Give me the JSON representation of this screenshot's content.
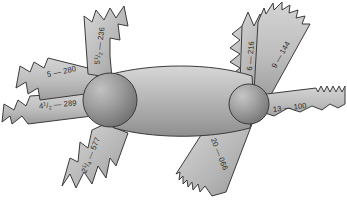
{
  "figure": {
    "background_color": "#ffffff",
    "outline_color": "#3b3b3b",
    "blade_fill_light": "#cfcfcf",
    "blade_fill_dark": "#9a9a9a",
    "body_fill_light": "#c6c6c6",
    "body_fill_dark": "#8e8e8e",
    "hub_fill_light": "#b5b5b5",
    "hub_fill_dark": "#6e6e6e",
    "label_color": "#2a2a2a"
  },
  "hubs": [
    {
      "name": "left-hub",
      "cx": 110,
      "cy": 100,
      "r": 27
    },
    {
      "name": "right-hub",
      "cx": 249,
      "cy": 104,
      "r": 20
    }
  ],
  "blades": [
    {
      "id": "blade-5-280",
      "side": "left",
      "position": "upper-left",
      "tpi": "5",
      "dash": "—",
      "code": "280",
      "label": "5 — 280",
      "tooth_size": "coarse"
    },
    {
      "id": "blade-5h-236",
      "side": "left",
      "position": "top",
      "tpi": "5",
      "fraction_num": "1",
      "fraction_den": "2",
      "dash": "—",
      "code": "236",
      "label": "5½ — 236",
      "tooth_size": "coarse"
    },
    {
      "id": "blade-4h-289",
      "side": "left",
      "position": "left",
      "tpi": "4",
      "fraction_num": "1",
      "fraction_den": "2",
      "dash": "—",
      "code": "289",
      "label": "4½ — 289",
      "tooth_size": "coarse"
    },
    {
      "id": "blade-2q-577",
      "side": "left",
      "position": "bottom-left",
      "tpi": "2",
      "fraction_num": "1",
      "fraction_den": "4",
      "dash": "—",
      "code": "577",
      "label": "2¼ — 577",
      "tooth_size": "very-coarse"
    },
    {
      "id": "blade-6-216",
      "side": "right",
      "position": "top",
      "tpi": "6",
      "dash": "—",
      "code": "216",
      "label": "6 — 216",
      "tooth_size": "coarse"
    },
    {
      "id": "blade-9-144",
      "side": "right",
      "position": "upper-right",
      "tpi": "9",
      "dash": "—",
      "code": "144",
      "label": "9 — 144",
      "tooth_size": "medium"
    },
    {
      "id": "blade-13-100",
      "side": "right",
      "position": "right",
      "tpi": "13",
      "dash": "—",
      "code": "100",
      "label": "13 — 100",
      "tooth_size": "fine"
    },
    {
      "id": "blade-20-066",
      "side": "right",
      "position": "bottom-right",
      "tpi": "20",
      "dash": "—",
      "code": "066",
      "label": "20 — 066",
      "tooth_size": "very-fine"
    }
  ]
}
